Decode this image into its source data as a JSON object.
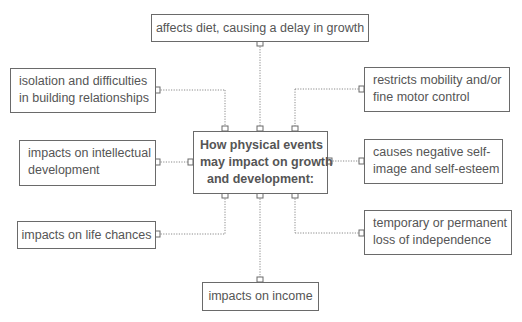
{
  "diagram": {
    "center": {
      "lines": [
        "How physical events",
        "may impact on growth",
        "and development:"
      ]
    },
    "nodes": {
      "top": {
        "text": "affects diet, causing a delay in growth"
      },
      "left_top": {
        "lines": [
          "isolation and difficulties",
          "in building relationships"
        ]
      },
      "left_middle": {
        "lines": [
          "impacts on intellectual",
          "development"
        ]
      },
      "left_bottom": {
        "text": "impacts on life chances"
      },
      "right_top": {
        "lines": [
          "restricts mobility and/or",
          "fine motor control"
        ]
      },
      "right_middle": {
        "lines": [
          "causes negative self-",
          "image and self-esteem"
        ]
      },
      "right_bottom": {
        "lines": [
          "temporary or permanent",
          "loss of independence"
        ]
      },
      "bottom": {
        "text": "impacts on income"
      }
    },
    "colors": {
      "border": "#6a6a6a",
      "text": "#555555",
      "connector": "#8a8a8a",
      "background": "#ffffff"
    }
  }
}
